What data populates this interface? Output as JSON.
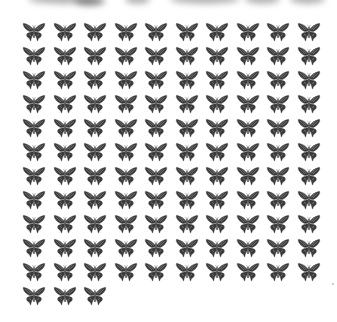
{
  "scene": {
    "description": "Grid of identical swallowtail butterfly silhouettes on white background",
    "background": "#ffffff",
    "top_strip": "blurred gray shapes cropped at top edge"
  },
  "grid": {
    "columns": 10,
    "full_rows": 11,
    "last_row_count": 3,
    "total_items": 113,
    "item_icon": "butterfly-icon",
    "item_color": "#3a3a3a",
    "col_pitch_px": 30.5,
    "row_pitch_px": 24
  }
}
